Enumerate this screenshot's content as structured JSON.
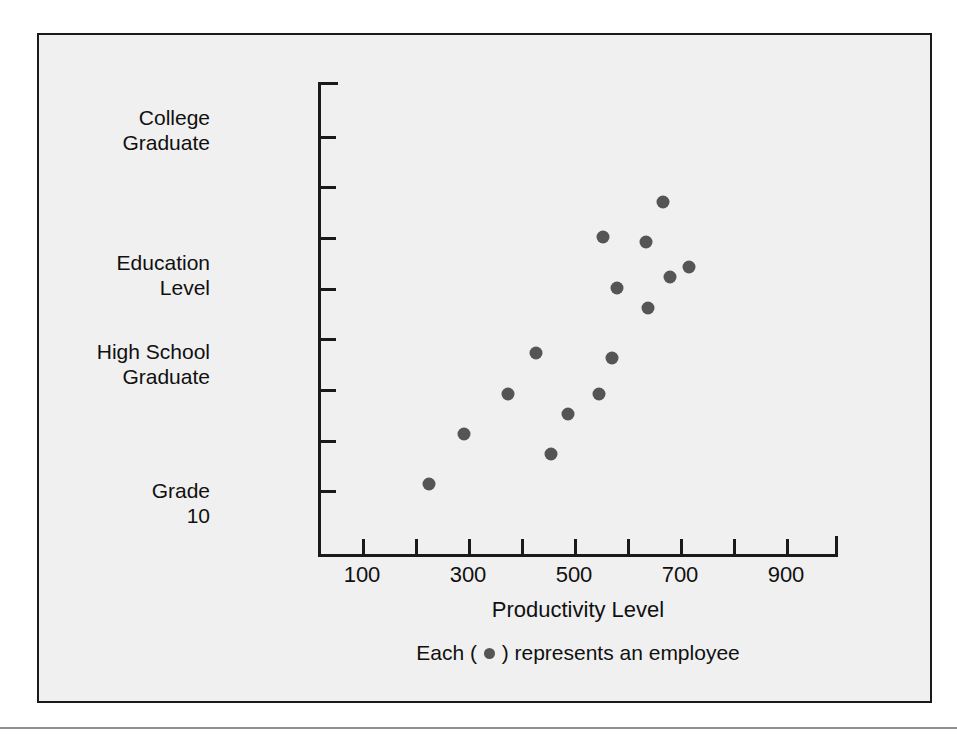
{
  "figure": {
    "background_color": "#f0f0f0",
    "border_color": "#1a1a1a",
    "marker_color": "#555555"
  },
  "caption": {
    "prefix": "Each (",
    "suffix": ") represents an employee",
    "marker_name": "employee-dot"
  },
  "chart_data": {
    "type": "scatter",
    "title": "",
    "xlabel": "Productivity Level",
    "ylabel": "Education Level",
    "xlim": [
      50,
      950
    ],
    "ylim": [
      0,
      9
    ],
    "grid": false,
    "legend": "Each ( ● ) represents an employee",
    "x_ticks": [
      100,
      200,
      300,
      400,
      500,
      600,
      700,
      800,
      900
    ],
    "x_tick_labels": [
      "100",
      "",
      "300",
      "",
      "500",
      "",
      "700",
      "",
      "900"
    ],
    "y_tick_count": 10,
    "y_category_labels": [
      {
        "label": "College\nGraduate",
        "value": 8
      },
      {
        "label": "Education\nLevel",
        "value": 4.5
      },
      {
        "label": "High School\nGraduate",
        "value": 3
      },
      {
        "label": "Grade\n10",
        "value": 0.8
      }
    ],
    "points": [
      {
        "x": 227,
        "y": 1.1
      },
      {
        "x": 293,
        "y": 2.1
      },
      {
        "x": 376,
        "y": 2.9
      },
      {
        "x": 429,
        "y": 3.7
      },
      {
        "x": 457,
        "y": 1.7
      },
      {
        "x": 489,
        "y": 2.5
      },
      {
        "x": 548,
        "y": 2.9
      },
      {
        "x": 555,
        "y": 6.0
      },
      {
        "x": 572,
        "y": 3.6
      },
      {
        "x": 581,
        "y": 5.0
      },
      {
        "x": 636,
        "y": 5.9
      },
      {
        "x": 640,
        "y": 4.6
      },
      {
        "x": 668,
        "y": 6.7
      },
      {
        "x": 681,
        "y": 5.2
      },
      {
        "x": 717,
        "y": 5.4
      }
    ],
    "point_count": 15
  },
  "axis_labels": {
    "y": [
      {
        "name": "college-graduate",
        "text": "College\nGraduate"
      },
      {
        "name": "education-level",
        "text": "Education\nLevel"
      },
      {
        "name": "high-school-graduate",
        "text": "High School\nGraduate"
      },
      {
        "name": "grade-10",
        "text": "Grade\n10"
      }
    ],
    "x": [
      "100",
      "300",
      "500",
      "700",
      "900"
    ],
    "x_title": "Productivity Level"
  }
}
